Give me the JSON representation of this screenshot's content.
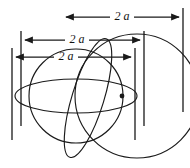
{
  "figure": {
    "background_color": "#ffffff",
    "stroke_color": "#1a1a1a",
    "width": 190,
    "height": 168
  },
  "dimensions": [
    {
      "id": "top",
      "label": "2 a",
      "label_x": 122,
      "label_y": 16,
      "line_y": 17,
      "x_start": 62,
      "x_end": 183,
      "arrow_left": true,
      "arrow_right": true
    },
    {
      "id": "middle",
      "label": "2 a",
      "label_x": 77,
      "label_y": 39,
      "line_y": 40,
      "x_start": 21,
      "x_end": 144,
      "arrow_left": true,
      "arrow_right": true
    },
    {
      "id": "bottom",
      "label": "2 a",
      "label_x": 66,
      "label_y": 56,
      "line_y": 57,
      "x_start": 12,
      "x_end": 135,
      "arrow_left": true,
      "arrow_right": true
    }
  ],
  "extension_lines": [
    {
      "id": "left-outer",
      "x": 12,
      "y_top": 48,
      "y_bottom": 140
    },
    {
      "id": "left-inner",
      "x": 21,
      "y_top": 31,
      "y_bottom": 126
    },
    {
      "id": "right-inner",
      "x": 135,
      "y_top": 48,
      "y_bottom": 140
    },
    {
      "id": "right-middle",
      "x": 144,
      "y_top": 31,
      "y_bottom": 126
    },
    {
      "id": "right-outer",
      "x": 183,
      "y_top": 8,
      "y_bottom": 112
    }
  ],
  "shapes": [
    {
      "id": "sphere-outline",
      "type": "circle",
      "cx": 76,
      "cy": 96,
      "r": 47,
      "note": "main sphere great circle"
    },
    {
      "id": "second-circle",
      "type": "circle",
      "cx": 137,
      "cy": 96,
      "r": 62,
      "note": "larger offset circle on the right"
    },
    {
      "id": "equator-ellipse",
      "type": "ellipse",
      "cx": 76,
      "cy": 96,
      "rx": 61,
      "ry": 17,
      "rotation": 0,
      "note": "flat horizontal equator of sphere"
    },
    {
      "id": "meridian-ellipse",
      "type": "ellipse",
      "cx": 88,
      "cy": 98,
      "rx": 16,
      "ry": 62,
      "rotation": 17,
      "note": "tilted narrow meridian ellipse"
    }
  ],
  "center_point": {
    "id": "sphere-center",
    "cx": 122,
    "cy": 96,
    "r": 2.4,
    "label": ""
  }
}
